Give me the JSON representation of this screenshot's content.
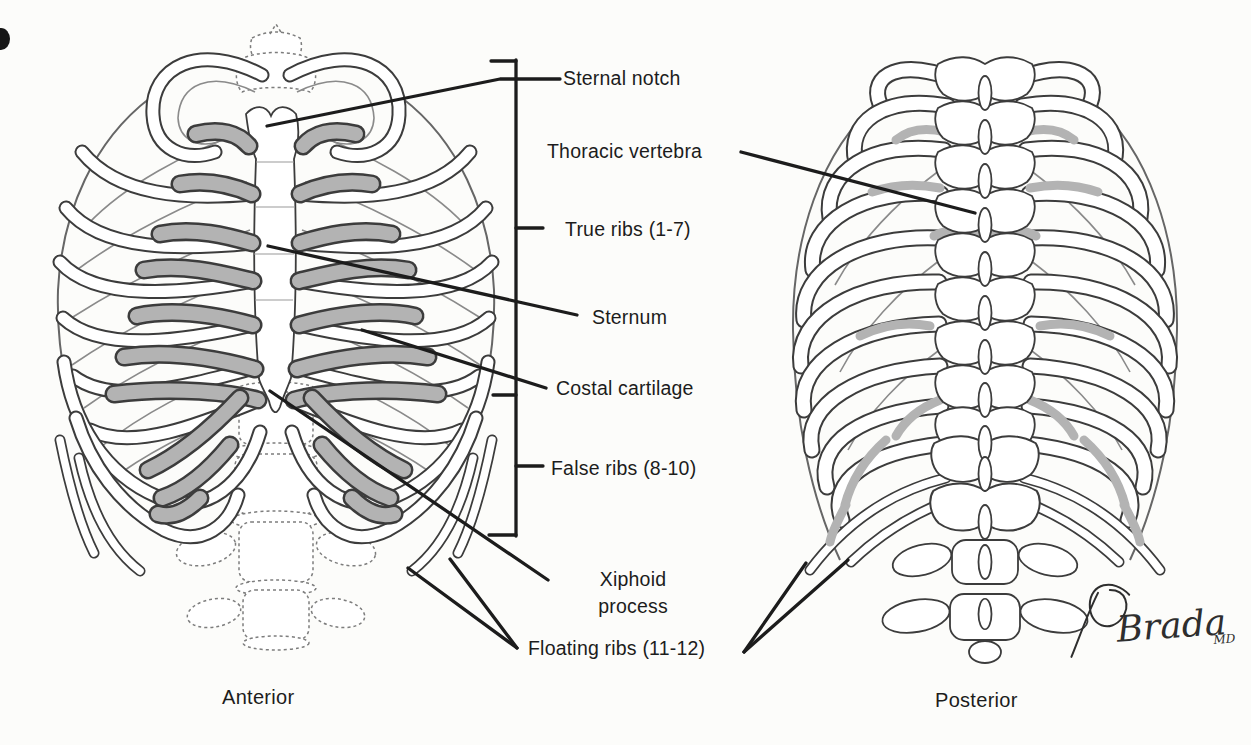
{
  "figure": {
    "labels": {
      "sternal_notch": "Sternal notch",
      "thoracic_vertebra": "Thoracic vertebra",
      "true_ribs": "True ribs (1-7)",
      "sternum": "Sternum",
      "costal_cartilage": "Costal cartilage",
      "false_ribs": "False ribs (8-10)",
      "xiphoid_process": "Xiphoid process",
      "floating_ribs": "Floating ribs (11-12)"
    },
    "captions": {
      "anterior": "Anterior",
      "posterior": "Posterior"
    },
    "signature": {
      "name": "Brada",
      "credential": "MD"
    },
    "colors": {
      "line": "#1c1c1c",
      "bone": "#3c3c3c",
      "cart": "#b3b3b3",
      "bg": "#fcfcfa",
      "faint": "#8a8a8a"
    }
  }
}
